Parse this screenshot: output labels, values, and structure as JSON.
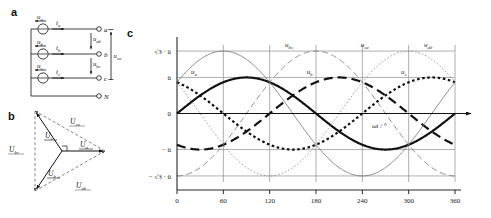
{
  "figure": {
    "panels": [
      {
        "letter": "a",
        "name": "circuit-schematic"
      },
      {
        "letter": "b",
        "name": "phasor-diagram"
      },
      {
        "letter": "c",
        "name": "waveform-chart"
      }
    ]
  },
  "circuit": {
    "sources": [
      {
        "label": "u",
        "sub": "a",
        "name": "source-ua"
      },
      {
        "label": "u",
        "sub": "b",
        "name": "source-ub"
      },
      {
        "label": "u",
        "sub": "c",
        "name": "source-uc"
      }
    ],
    "currents": [
      {
        "label": "i",
        "sub": "a"
      },
      {
        "label": "i",
        "sub": "b"
      },
      {
        "label": "i",
        "sub": "c"
      }
    ],
    "terminals": [
      {
        "label": "a"
      },
      {
        "label": "b"
      },
      {
        "label": "c"
      },
      {
        "label": "N"
      }
    ],
    "line_voltages": [
      {
        "label": "u",
        "sub": "ab"
      },
      {
        "label": "u",
        "sub": "bc"
      },
      {
        "label": "u",
        "sub": "ca"
      }
    ]
  },
  "phasor": {
    "phase_phasors": [
      {
        "label": "U",
        "sub": "a",
        "angle_deg": 0
      },
      {
        "label": "U",
        "sub": "b",
        "angle_deg": 240
      },
      {
        "label": "U",
        "sub": "c",
        "angle_deg": 120
      }
    ],
    "line_phasors": [
      {
        "label": "U",
        "sub": "ab"
      },
      {
        "label": "U",
        "sub": "bc"
      },
      {
        "label": "U",
        "sub": "ca"
      }
    ]
  },
  "chart_data": {
    "type": "line",
    "title": "",
    "xlabel": "ωt / °",
    "ylabel": "",
    "x": [
      0,
      60,
      120,
      180,
      240,
      300,
      360
    ],
    "xticklabels": [
      "0",
      "60",
      "120",
      "180",
      "240",
      "300",
      "360"
    ],
    "xlim": [
      0,
      360
    ],
    "ylim": [
      -1.9,
      1.9
    ],
    "yticks": [
      1.732,
      1,
      0,
      -1,
      -1.732
    ],
    "yticklabels": [
      "√3 · û",
      "û",
      "0",
      "− û",
      "− √3 · û"
    ],
    "grid": true,
    "legend": "inline-curve-labels",
    "series": [
      {
        "name": "u_a",
        "label": "u",
        "sub": "a",
        "amplitude": 1,
        "phase_deg": 0,
        "style": "thick-solid",
        "curve_label_x": 18,
        "curve_label_y": 1.02
      },
      {
        "name": "u_b",
        "label": "u",
        "sub": "b",
        "amplitude": 1,
        "phase_deg": -120,
        "style": "thick-dashed",
        "curve_label_x": 168,
        "curve_label_y": 1.02
      },
      {
        "name": "u_c",
        "label": "u",
        "sub": "c",
        "amplitude": 1,
        "phase_deg": -240,
        "style": "thick-dotted",
        "curve_label_x": 290,
        "curve_label_y": 1.02
      },
      {
        "name": "u_ab",
        "label": "u",
        "sub": "ab",
        "amplitude": 1.732,
        "phase_deg": 30,
        "style": "thin-solid",
        "curve_label_x": 320,
        "curve_label_y": 1.78
      },
      {
        "name": "u_bc",
        "label": "u",
        "sub": "bc",
        "amplitude": 1.732,
        "phase_deg": -90,
        "style": "thin-dashed",
        "curve_label_x": 140,
        "curve_label_y": 1.78
      },
      {
        "name": "u_ca",
        "label": "u",
        "sub": "ca",
        "amplitude": 1.732,
        "phase_deg": -210,
        "style": "thin-dotted",
        "curve_label_x": 238,
        "curve_label_y": 1.78
      }
    ]
  },
  "colors": {
    "ink": "#111111",
    "grid": "#999999",
    "background": "#ffffff"
  }
}
